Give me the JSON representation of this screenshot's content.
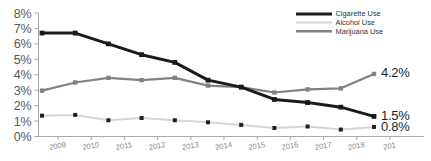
{
  "chart_data": {
    "type": "line",
    "title": "",
    "xlabel": "",
    "ylabel": "",
    "ylim": [
      0,
      8
    ],
    "grid": false,
    "legend_position": "top-right",
    "y_tick_labels": [
      "8%",
      "7%",
      "6%",
      "5%",
      "4%",
      "3%",
      "2%",
      "1%",
      "0%"
    ],
    "y_tick_values": [
      8,
      7,
      6,
      5,
      4,
      3,
      2,
      1,
      0
    ],
    "x_tick_labels": [
      "2009",
      "2010",
      "2011",
      "2012",
      "2013",
      "2014",
      "2015",
      "2016",
      "2017",
      "2018",
      "201"
    ],
    "categories": [
      2009,
      2010,
      2011,
      2012,
      2013,
      2014,
      2015,
      2016,
      2017,
      2018,
      2019
    ],
    "series": [
      {
        "name": "Cigarette Use",
        "color": "#1a1a1a",
        "values": [
          6.7,
          6.7,
          6.0,
          5.3,
          4.8,
          3.65,
          3.2,
          2.4,
          2.2,
          1.9,
          1.3
        ],
        "end_label": "1.5%"
      },
      {
        "name": "Alcohol Use",
        "color": "#d4d5d7",
        "values": [
          1.35,
          1.4,
          1.05,
          1.2,
          1.05,
          0.92,
          0.75,
          0.55,
          0.65,
          0.45,
          0.62
        ],
        "end_label": "0.8%"
      },
      {
        "name": "Marijuana Use",
        "color": "#808285",
        "values": [
          2.97,
          3.5,
          3.8,
          3.65,
          3.8,
          3.3,
          3.2,
          2.85,
          3.05,
          3.12,
          4.05
        ],
        "end_label": "4.2%"
      }
    ]
  },
  "legend": {
    "entries": [
      {
        "label": "Cigarette Use",
        "color": "#1a1a1a"
      },
      {
        "label": "Alcohol Use",
        "color": "#d4d5d7"
      },
      {
        "label": "Marijuana Use",
        "color": "#808285"
      }
    ]
  },
  "end_labels": {
    "marijuana": "4.2%",
    "cigarette": "1.5%",
    "alcohol": "0.8%"
  }
}
